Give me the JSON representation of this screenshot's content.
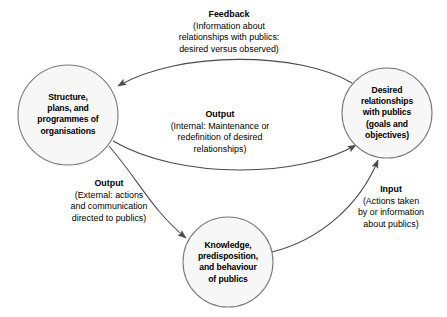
{
  "diagram": {
    "background_color": "#ffffff",
    "node_fill_color": "#f7f7f7",
    "node_stroke_color": "#7a7a7a",
    "edge_color": "#555555",
    "text_color": "#000000",
    "nodes": [
      {
        "id": "structure",
        "name": "structure-node",
        "lines": [
          "Structure,",
          "plans, and",
          "programmes of",
          "organisations"
        ],
        "cx": 68,
        "cy": 115,
        "r": 50
      },
      {
        "id": "desired",
        "name": "desired-relationships-node",
        "lines": [
          "Desired",
          "relationships",
          "with publics",
          "(goals and",
          "objectives)"
        ],
        "cx": 387,
        "cy": 113,
        "r": 45
      },
      {
        "id": "knowledge",
        "name": "knowledge-node",
        "lines": [
          "Knowledge,",
          "predisposition,",
          "and behaviour",
          "of publics"
        ],
        "cx": 228,
        "cy": 262,
        "r": 45
      }
    ],
    "edges": [
      {
        "id": "feedback",
        "name": "feedback-edge",
        "title": "Feedback",
        "body": [
          "(Information about",
          "relationships with publics:",
          "desired versus observed)"
        ],
        "from": "desired",
        "to": "structure"
      },
      {
        "id": "output_internal",
        "name": "output-internal-edge",
        "title": "Output",
        "body": [
          "(Internal: Maintenance or",
          "redefinition of desired",
          "relationships)"
        ],
        "from": "structure",
        "to": "desired"
      },
      {
        "id": "output_external",
        "name": "output-external-edge",
        "title": "Output",
        "body": [
          "(External: actions",
          "and communication",
          "directed to publics)"
        ],
        "from": "structure",
        "to": "knowledge"
      },
      {
        "id": "input",
        "name": "input-edge",
        "title": "Input",
        "body": [
          "(Actions taken",
          "by or information",
          "about publics)"
        ],
        "from": "knowledge",
        "to": "desired"
      }
    ]
  }
}
